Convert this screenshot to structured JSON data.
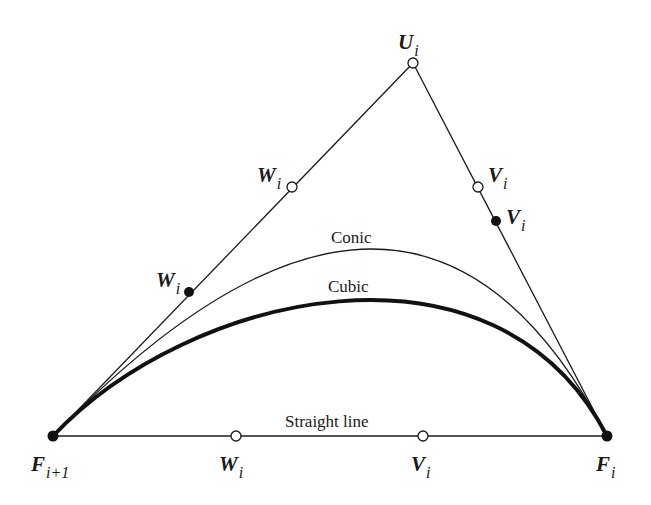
{
  "colors": {
    "ink": "#1a1a1a",
    "background": "#ffffff"
  },
  "points": {
    "F_next": {
      "symbol": "F",
      "subscript": "i+1",
      "marker": "filled"
    },
    "F_i": {
      "symbol": "F",
      "subscript": "i",
      "marker": "filled"
    },
    "U_i": {
      "symbol": "U",
      "subscript": "i",
      "marker": "open"
    },
    "W_i_left_open": {
      "symbol": "W",
      "subscript": "i",
      "marker": "open"
    },
    "W_i_left_filled": {
      "symbol": "W",
      "subscript": "i",
      "marker": "filled"
    },
    "V_i_right_open": {
      "symbol": "V",
      "subscript": "i",
      "marker": "open"
    },
    "V_i_right_filled": {
      "symbol": "V",
      "subscript": "i",
      "marker": "filled"
    },
    "W_i_base": {
      "symbol": "W",
      "subscript": "i",
      "marker": "open"
    },
    "V_i_base": {
      "symbol": "V",
      "subscript": "i",
      "marker": "open"
    }
  },
  "curves": {
    "conic": "Conic",
    "cubic": "Cubic",
    "straight": "Straight line"
  }
}
